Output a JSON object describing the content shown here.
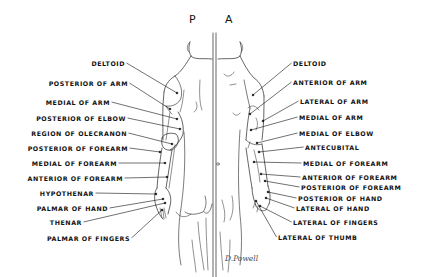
{
  "figure": {
    "views": {
      "posterior": "P",
      "anterior": "A"
    },
    "signature": "D.Powell",
    "posterior_labels": [
      {
        "text": "DELTOID",
        "right": 125,
        "y": 63,
        "tx": 177,
        "ty": 93
      },
      {
        "text": "POSTERIOR OF ARM",
        "right": 128,
        "y": 83,
        "tx": 170,
        "ty": 109
      },
      {
        "text": "MEDIAL OF ARM",
        "right": 110,
        "y": 102,
        "tx": 177,
        "ty": 119
      },
      {
        "text": "POSTERIOR OF ELBOW",
        "right": 126,
        "y": 118,
        "tx": 180,
        "ty": 129
      },
      {
        "text": "REGION OF OLECRANON",
        "right": 127,
        "y": 133,
        "tx": 172,
        "ty": 144
      },
      {
        "text": "POSTERIOR OF FOREARM",
        "right": 128,
        "y": 148,
        "tx": 160,
        "ty": 152
      },
      {
        "text": "MEDIAL OF FOREARM",
        "right": 117,
        "y": 163,
        "tx": 165,
        "ty": 163
      },
      {
        "text": "ANTERIOR OF FOREARM",
        "right": 123,
        "y": 178,
        "tx": 167,
        "ty": 177
      },
      {
        "text": "HYPOTHENAR",
        "right": 94,
        "y": 193,
        "tx": 156,
        "ty": 194
      },
      {
        "text": "PALMAR OF HAND",
        "right": 108,
        "y": 208,
        "tx": 163,
        "ty": 199
      },
      {
        "text": "THENAR",
        "right": 82,
        "y": 222,
        "tx": 165,
        "ty": 203
      },
      {
        "text": "PALMAR OF FINGERS",
        "right": 130,
        "y": 238,
        "tx": 162,
        "ty": 210
      }
    ],
    "anterior_labels": [
      {
        "text": "DELTOID",
        "left": 293,
        "y": 63,
        "tx": 253,
        "ty": 95
      },
      {
        "text": "ANTERIOR OF ARM",
        "left": 293,
        "y": 82,
        "tx": 250,
        "ty": 114
      },
      {
        "text": "LATERAL OF ARM",
        "left": 300,
        "y": 101,
        "tx": 263,
        "ty": 121
      },
      {
        "text": "MEDIAL OF ARM",
        "left": 299,
        "y": 117,
        "tx": 251,
        "ty": 130
      },
      {
        "text": "MEDIAL OF ELBOW",
        "left": 299,
        "y": 133,
        "tx": 257,
        "ty": 143
      },
      {
        "text": "ANTECUBITAL",
        "left": 305,
        "y": 147,
        "tx": 259,
        "ty": 152
      },
      {
        "text": "MEDIAL OF FOREARM",
        "left": 303,
        "y": 163,
        "tx": 254,
        "ty": 162
      },
      {
        "text": "ANTERIOR OF FOREARM",
        "left": 302,
        "y": 177,
        "tx": 261,
        "ty": 174
      },
      {
        "text": "POSTERIOR OF FOREARM",
        "left": 301,
        "y": 187,
        "tx": 265,
        "ty": 181
      },
      {
        "text": "POSTERIOR OF HAND",
        "left": 298,
        "y": 198,
        "tx": 268,
        "ty": 192
      },
      {
        "text": "LATERAL OF HAND",
        "left": 296,
        "y": 208,
        "tx": 266,
        "ty": 198
      },
      {
        "text": "LATERAL OF FINGERS",
        "left": 293,
        "y": 222,
        "tx": 260,
        "ty": 206
      },
      {
        "text": "LATERAL OF THUMB",
        "left": 278,
        "y": 237,
        "tx": 256,
        "ty": 201
      }
    ]
  }
}
